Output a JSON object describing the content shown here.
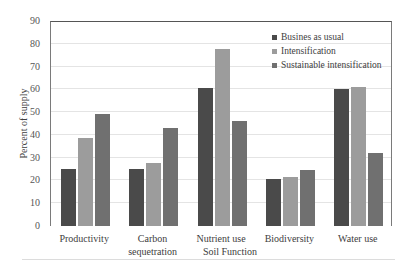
{
  "chart_data": {
    "type": "bar",
    "title": "",
    "xlabel": "Soil Function",
    "ylabel": "Percent of supply",
    "ylim": [
      0,
      90
    ],
    "yticks": [
      0,
      10,
      20,
      30,
      40,
      50,
      60,
      70,
      80,
      90
    ],
    "grid": true,
    "legend_position": "top-right inside",
    "categories": [
      "Productivity",
      "Carbon sequetration",
      "Nutrient use",
      "Biodiversity",
      "Water use"
    ],
    "series": [
      {
        "name": "Busines as usual",
        "color": "#4a4a4a",
        "values": [
          25,
          25,
          60.5,
          20.5,
          60
        ]
      },
      {
        "name": "Intensification",
        "color": "#9c9c9c",
        "values": [
          38.5,
          27.5,
          77.5,
          21.5,
          61
        ]
      },
      {
        "name": "Sustainable intensification",
        "color": "#707070",
        "values": [
          49,
          43,
          46,
          24.5,
          32
        ]
      }
    ]
  },
  "labels": {
    "x_axis_title": "Soil Function",
    "y_axis_title": "Percent of supply",
    "categories": [
      "Productivity",
      "Carbon\nsequetration",
      "Nutrient use",
      "Biodiversity",
      "Water use"
    ],
    "legend": [
      "Busines as usual",
      "Intensification",
      "Sustainable intensification"
    ]
  }
}
